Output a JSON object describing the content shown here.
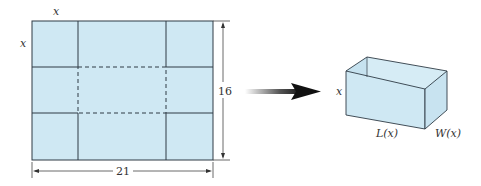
{
  "sheet": {
    "corner_cut_top_label": "x",
    "corner_cut_side_label": "x",
    "height_label": "16",
    "width_label": "21",
    "fill_color": "#cfe8f3",
    "line_color": "#2f3b45"
  },
  "transform_arrow": {
    "icon": "arrow-right-icon"
  },
  "box": {
    "height_label": "x",
    "length_label": "L(x)",
    "width_label": "W(x)",
    "fill_color": "#cfe8f3"
  }
}
